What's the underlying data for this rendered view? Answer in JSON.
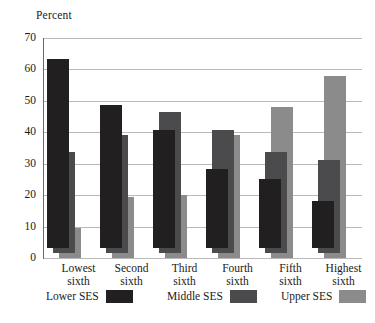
{
  "chart_data": {
    "type": "bar",
    "title": "",
    "xlabel": "",
    "ylabel": "Percent",
    "ylim": [
      0,
      70
    ],
    "yticks": [
      0,
      10,
      20,
      30,
      40,
      50,
      60,
      70
    ],
    "ytick_labels": [
      "0",
      "10",
      "20",
      "30",
      "40",
      "50",
      "60",
      "70"
    ],
    "grid": true,
    "legend_position": "bottom",
    "categories": [
      "Lowest sixth",
      "Second sixth",
      "Third sixth",
      "Fourth sixth",
      "Fifth sixth",
      "Highest sixth"
    ],
    "category_lines": [
      [
        "Lowest",
        "sixth"
      ],
      [
        "Second",
        "sixth"
      ],
      [
        "Third",
        "sixth"
      ],
      [
        "Fourth",
        "sixth"
      ],
      [
        "Fifth",
        "sixth"
      ],
      [
        "Highest",
        "sixth"
      ]
    ],
    "series": [
      {
        "name": "Lower SES",
        "color": "#211f20",
        "values": [
          60,
          45.5,
          37.5,
          25,
          22,
          15
        ]
      },
      {
        "name": "Middle SES",
        "color": "#4b4a4c",
        "values": [
          32,
          37.5,
          45,
          39,
          32,
          29.5
        ]
      },
      {
        "name": "Upper SES",
        "color": "#8b8b8b",
        "values": [
          9.5,
          19.5,
          20,
          39,
          48,
          58
        ]
      }
    ]
  },
  "legend": {
    "items": [
      {
        "label": "Lower SES",
        "color": "#211f20"
      },
      {
        "label": "Middle SES",
        "color": "#4b4a4c"
      },
      {
        "label": "Upper SES",
        "color": "#8b8b8b"
      }
    ]
  },
  "colors": {
    "background": "#ffffff",
    "gridline": "#b9b9b9",
    "axis": "#6a6a6a",
    "text": "#1a1a1a"
  }
}
